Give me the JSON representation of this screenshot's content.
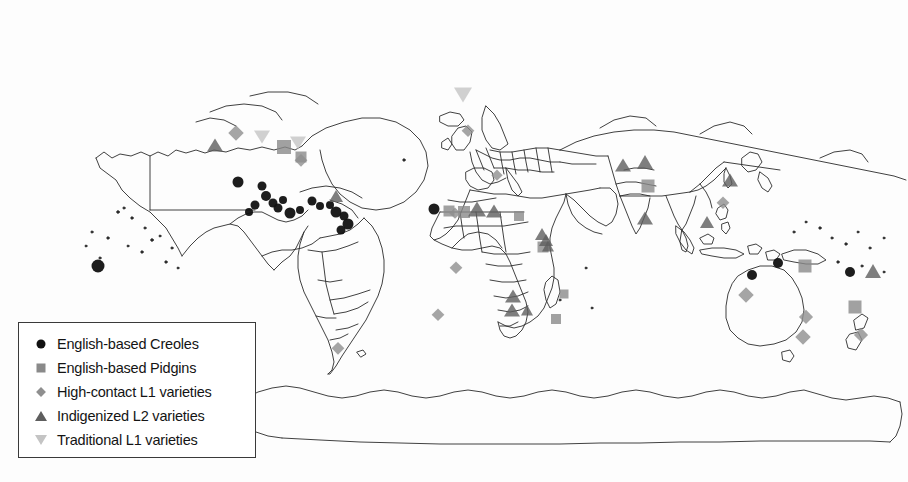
{
  "figure": {
    "kind": "world-map",
    "title": "",
    "background": "#ffffff",
    "coastline_color": "#2b2b2b"
  },
  "legend": {
    "name": "map-legend",
    "border_color": "#3a3a3a",
    "items": [
      {
        "label": "English-based Creoles",
        "symbol": "circle",
        "color": "#111111",
        "size": 9
      },
      {
        "label": "English-based Pidgins",
        "symbol": "square",
        "color": "#8a8a8a",
        "size": 9
      },
      {
        "label": "High-contact L1 varieties",
        "symbol": "diamond",
        "color": "#8f8f8f",
        "size": 9
      },
      {
        "label": "Indigenized L2 varieties",
        "symbol": "triangle-up",
        "color": "#5e5e5e",
        "size": 10
      },
      {
        "label": "Traditional L1 varieties",
        "symbol": "triangle-down",
        "color": "#c4c4c4",
        "size": 10
      }
    ]
  },
  "markers": [
    {
      "cat": 0,
      "x": 98,
      "y": 266,
      "s": 13
    },
    {
      "cat": 0,
      "x": 238,
      "y": 182,
      "s": 11
    },
    {
      "cat": 0,
      "x": 262,
      "y": 186,
      "s": 9
    },
    {
      "cat": 0,
      "x": 266,
      "y": 196,
      "s": 10
    },
    {
      "cat": 0,
      "x": 273,
      "y": 203,
      "s": 9
    },
    {
      "cat": 0,
      "x": 283,
      "y": 200,
      "s": 8
    },
    {
      "cat": 0,
      "x": 255,
      "y": 205,
      "s": 9
    },
    {
      "cat": 0,
      "x": 249,
      "y": 212,
      "s": 8
    },
    {
      "cat": 0,
      "x": 278,
      "y": 208,
      "s": 9
    },
    {
      "cat": 0,
      "x": 290,
      "y": 213,
      "s": 11
    },
    {
      "cat": 0,
      "x": 300,
      "y": 210,
      "s": 8
    },
    {
      "cat": 0,
      "x": 312,
      "y": 201,
      "s": 9
    },
    {
      "cat": 0,
      "x": 320,
      "y": 206,
      "s": 8
    },
    {
      "cat": 0,
      "x": 330,
      "y": 205,
      "s": 8
    },
    {
      "cat": 0,
      "x": 336,
      "y": 212,
      "s": 11
    },
    {
      "cat": 0,
      "x": 344,
      "y": 216,
      "s": 9
    },
    {
      "cat": 0,
      "x": 348,
      "y": 224,
      "s": 11
    },
    {
      "cat": 0,
      "x": 341,
      "y": 230,
      "s": 9
    },
    {
      "cat": 0,
      "x": 434,
      "y": 209,
      "s": 11
    },
    {
      "cat": 0,
      "x": 752,
      "y": 275,
      "s": 10
    },
    {
      "cat": 0,
      "x": 778,
      "y": 263,
      "s": 10
    },
    {
      "cat": 0,
      "x": 850,
      "y": 272,
      "s": 10
    },
    {
      "cat": 1,
      "x": 284,
      "y": 147,
      "s": 14
    },
    {
      "cat": 1,
      "x": 301,
      "y": 157,
      "s": 11
    },
    {
      "cat": 1,
      "x": 449,
      "y": 211,
      "s": 11
    },
    {
      "cat": 1,
      "x": 464,
      "y": 212,
      "s": 12
    },
    {
      "cat": 1,
      "x": 519,
      "y": 216,
      "s": 10
    },
    {
      "cat": 1,
      "x": 543,
      "y": 247,
      "s": 11
    },
    {
      "cat": 1,
      "x": 564,
      "y": 294,
      "s": 9
    },
    {
      "cat": 1,
      "x": 556,
      "y": 319,
      "s": 10
    },
    {
      "cat": 1,
      "x": 648,
      "y": 186,
      "s": 13
    },
    {
      "cat": 1,
      "x": 805,
      "y": 266,
      "s": 13
    },
    {
      "cat": 1,
      "x": 855,
      "y": 307,
      "s": 13
    },
    {
      "cat": 2,
      "x": 236,
      "y": 133,
      "s": 14
    },
    {
      "cat": 2,
      "x": 301,
      "y": 160,
      "s": 11
    },
    {
      "cat": 2,
      "x": 497,
      "y": 175,
      "s": 10
    },
    {
      "cat": 2,
      "x": 455,
      "y": 213,
      "s": 10
    },
    {
      "cat": 2,
      "x": 456,
      "y": 268,
      "s": 12
    },
    {
      "cat": 2,
      "x": 438,
      "y": 315,
      "s": 12
    },
    {
      "cat": 2,
      "x": 338,
      "y": 348,
      "s": 11
    },
    {
      "cat": 2,
      "x": 468,
      "y": 131,
      "s": 12
    },
    {
      "cat": 2,
      "x": 723,
      "y": 203,
      "s": 12
    },
    {
      "cat": 2,
      "x": 746,
      "y": 295,
      "s": 14
    },
    {
      "cat": 2,
      "x": 806,
      "y": 317,
      "s": 13
    },
    {
      "cat": 2,
      "x": 803,
      "y": 337,
      "s": 14
    },
    {
      "cat": 2,
      "x": 861,
      "y": 335,
      "s": 13
    },
    {
      "cat": 3,
      "x": 215,
      "y": 145,
      "s": 13
    },
    {
      "cat": 3,
      "x": 336,
      "y": 196,
      "s": 12
    },
    {
      "cat": 3,
      "x": 477,
      "y": 209,
      "s": 15
    },
    {
      "cat": 3,
      "x": 494,
      "y": 211,
      "s": 13
    },
    {
      "cat": 3,
      "x": 542,
      "y": 234,
      "s": 12
    },
    {
      "cat": 3,
      "x": 546,
      "y": 240,
      "s": 12
    },
    {
      "cat": 3,
      "x": 548,
      "y": 246,
      "s": 11
    },
    {
      "cat": 3,
      "x": 513,
      "y": 296,
      "s": 13
    },
    {
      "cat": 3,
      "x": 512,
      "y": 310,
      "s": 13
    },
    {
      "cat": 3,
      "x": 527,
      "y": 310,
      "s": 11
    },
    {
      "cat": 3,
      "x": 623,
      "y": 165,
      "s": 13
    },
    {
      "cat": 3,
      "x": 645,
      "y": 162,
      "s": 14
    },
    {
      "cat": 3,
      "x": 645,
      "y": 218,
      "s": 13
    },
    {
      "cat": 3,
      "x": 730,
      "y": 180,
      "s": 13
    },
    {
      "cat": 3,
      "x": 707,
      "y": 222,
      "s": 12
    },
    {
      "cat": 3,
      "x": 873,
      "y": 271,
      "s": 14
    },
    {
      "cat": 4,
      "x": 463,
      "y": 95,
      "s": 15
    },
    {
      "cat": 4,
      "x": 262,
      "y": 137,
      "s": 13
    },
    {
      "cat": 4,
      "x": 298,
      "y": 143,
      "s": 13
    }
  ]
}
